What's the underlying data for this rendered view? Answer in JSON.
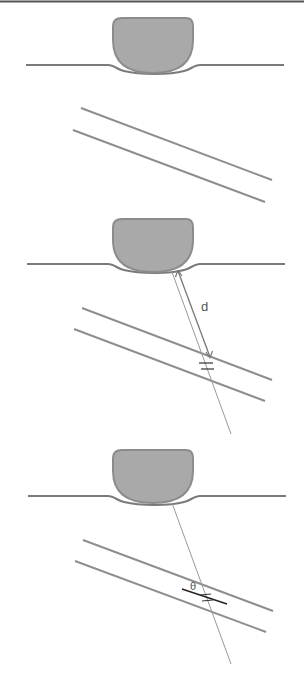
{
  "colors": {
    "background": "#ffffff",
    "top_rule": "#555555",
    "blob_fill": "#a9a9a9",
    "blob_stroke": "#8c8c8c",
    "surface_line": "#7a7a7a",
    "layer_lines": "#8e8e8e",
    "ray": "#999999",
    "arrow": "#777777",
    "angle_line": "#222222"
  },
  "panels": [
    {
      "id": "panel-1",
      "offset_y": 0,
      "labels": {}
    },
    {
      "id": "panel-2",
      "offset_y": 199,
      "labels": {
        "distance": "d"
      }
    },
    {
      "id": "panel-3",
      "offset_y": 431,
      "labels": {
        "angle": "θ"
      }
    }
  ]
}
